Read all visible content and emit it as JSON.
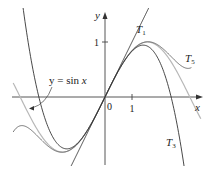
{
  "chart_data": {
    "type": "line",
    "title": "",
    "xlabel": "x",
    "ylabel": "y",
    "origin_label": "0",
    "x_ticks": [
      {
        "value": 1,
        "label": "1"
      }
    ],
    "y_ticks": [
      {
        "value": 1,
        "label": "1"
      }
    ],
    "xlim": [
      -3.4,
      3.6
    ],
    "ylim": [
      -1.25,
      1.6
    ],
    "grid": false,
    "legend": "none",
    "series": [
      {
        "name": "y = sin x",
        "function": "sin(x)",
        "color": "#b5b5b5"
      },
      {
        "name": "T1",
        "function": "x",
        "color": "#333333"
      },
      {
        "name": "T3",
        "function": "x - x^3/6",
        "color": "#333333"
      },
      {
        "name": "T5",
        "function": "x - x^3/6 + x^5/120",
        "color": "#555555"
      }
    ],
    "annotations": [
      {
        "text": "y = sin x",
        "points_to": "sin curve near x≈-2.9"
      },
      {
        "text": "T1"
      },
      {
        "text": "T3"
      },
      {
        "text": "T5"
      }
    ]
  },
  "labels": {
    "y_axis": "y",
    "x_axis": "x",
    "origin": "0",
    "x_tick_1": "1",
    "y_tick_1": "1",
    "sin_label_lhs": "y = sin ",
    "sin_label_var": "x",
    "T1": "T",
    "T1_sub": "1",
    "T3": "T",
    "T3_sub": "3",
    "T5": "T",
    "T5_sub": "5"
  }
}
